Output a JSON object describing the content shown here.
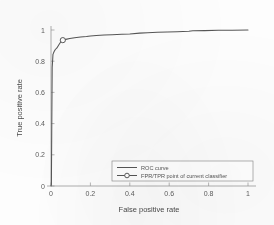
{
  "chart_data": {
    "type": "line",
    "title": "",
    "xlabel": "False positive rate",
    "ylabel": "True positive rate",
    "xlim": [
      0,
      1
    ],
    "ylim": [
      0,
      1
    ],
    "grid": false,
    "legend_position": "lower-right",
    "xticks": [
      "0",
      "0.2",
      "0.4",
      "0.6",
      "0.8",
      "1"
    ],
    "xtick_values": [
      0,
      0.2,
      0.4,
      0.6,
      0.8,
      1
    ],
    "yticks": [
      "0",
      "0.2",
      "0.4",
      "0.6",
      "0.8",
      "1"
    ],
    "ytick_values": [
      0,
      0.2,
      0.4,
      0.6,
      0.8,
      1
    ],
    "series": [
      {
        "name": "ROC curve",
        "color": "#565656",
        "x": [
          0.0,
          0.002,
          0.004,
          0.006,
          0.008,
          0.01,
          0.012,
          0.016,
          0.022,
          0.03,
          0.04,
          0.05,
          0.06,
          0.075,
          0.095,
          0.12,
          0.15,
          0.18,
          0.2,
          0.23,
          0.27,
          0.31,
          0.36,
          0.4,
          0.45,
          0.49,
          0.54,
          0.59,
          0.64,
          0.7,
          0.72,
          0.78,
          0.85,
          0.92,
          1.0
        ],
        "y": [
          0.0,
          0.01,
          0.4,
          0.76,
          0.8,
          0.845,
          0.85,
          0.862,
          0.875,
          0.885,
          0.905,
          0.925,
          0.935,
          0.94,
          0.945,
          0.95,
          0.955,
          0.958,
          0.962,
          0.965,
          0.968,
          0.97,
          0.973,
          0.975,
          0.98,
          0.983,
          0.985,
          0.987,
          0.989,
          0.992,
          0.995,
          0.996,
          0.998,
          0.999,
          1.0
        ]
      }
    ],
    "annotations": [
      {
        "name": "FPR/TPR point of current classifier",
        "marker": "circle-open",
        "x": 0.06,
        "y": 0.935
      }
    ],
    "legend_entries": [
      {
        "label": "ROC curve",
        "marker": "line"
      },
      {
        "label": "FPR/TPR point of current classifier",
        "marker": "line-circle"
      }
    ]
  }
}
